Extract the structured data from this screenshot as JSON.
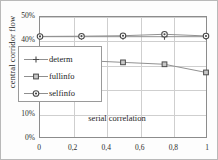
{
  "chart_data": {
    "type": "line",
    "title": "",
    "xlabel": "serial correlation",
    "ylabel": "central corridor flow",
    "x": [
      0,
      0.25,
      0.5,
      0.75,
      1
    ],
    "xtick_labels": [
      "0",
      "0,2",
      "0,4",
      "0,6",
      "0,8",
      "1"
    ],
    "xtick_values": [
      0,
      0.2,
      0.4,
      0.6,
      0.8,
      1
    ],
    "ytick_labels": [
      "50%",
      "40%",
      "30%",
      "20%",
      "10%",
      "0%"
    ],
    "ytick_values": [
      50,
      40,
      30,
      20,
      10,
      0
    ],
    "xlim": [
      0,
      1
    ],
    "ylim": [
      0,
      50
    ],
    "grid": true,
    "legend_position": "center-left",
    "series": [
      {
        "name": "determ",
        "marker": "plus",
        "values": [
          41.8,
          41.8,
          41.8,
          41.8,
          41.8
        ]
      },
      {
        "name": "fullinfo",
        "marker": "square",
        "values": [
          32.4,
          31.9,
          31.1,
          30.3,
          26.9
        ]
      },
      {
        "name": "selfinfo",
        "marker": "circle",
        "values": [
          41.9,
          42.0,
          42.2,
          42.8,
          42.1
        ]
      }
    ]
  },
  "legend": {
    "items": [
      {
        "label": "determ",
        "marker": "plus-marker"
      },
      {
        "label": "fullinfo",
        "marker": "square-marker"
      },
      {
        "label": "selfinfo",
        "marker": "circle-marker"
      }
    ]
  },
  "colors": {
    "line": "#8f8f8f",
    "marker_stroke": "#4a4a4a",
    "marker_fill": "#c8c8c8",
    "grid": "#cfcfcf",
    "axis": "#8c8c8c",
    "text": "#1e1e1e",
    "background": "#ffffff"
  }
}
